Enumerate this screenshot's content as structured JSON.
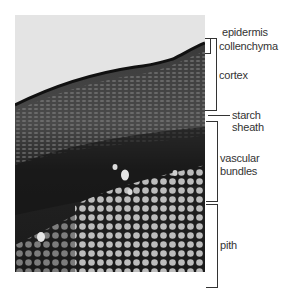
{
  "figure": {
    "labels": {
      "epidermis": "epidermis",
      "collenchyma": "collenchyma",
      "cortex": "cortex",
      "starch_sheath_1": "starch",
      "starch_sheath_2": "sheath",
      "vascular_1": "vascular",
      "vascular_2": "bundles",
      "pith": "pith"
    }
  }
}
